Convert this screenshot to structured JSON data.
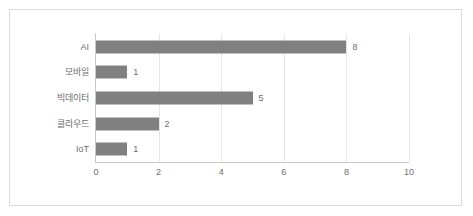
{
  "chart_data": {
    "type": "bar",
    "orientation": "horizontal",
    "title": "",
    "xlabel": "",
    "ylabel": "",
    "categories": [
      "AI",
      "모바일",
      "빅데이터",
      "클라우드",
      "IoT"
    ],
    "values": [
      8,
      1,
      5,
      2,
      1
    ],
    "value_labels": [
      "8",
      "1",
      "5",
      "2",
      "1"
    ],
    "xlim": [
      0,
      10
    ],
    "xticks": [
      0,
      2,
      4,
      6,
      8,
      10
    ],
    "xtick_labels": [
      "0",
      "2",
      "4",
      "6",
      "8",
      "10"
    ],
    "grid": "vertical",
    "legend": "none",
    "colors": {
      "bar": "#808080",
      "gridline": "#e6e6e6",
      "axis": "#c9c9c9",
      "border": "#dcdcdc",
      "background": "#ffffff",
      "text": "#6e6e6e"
    }
  }
}
